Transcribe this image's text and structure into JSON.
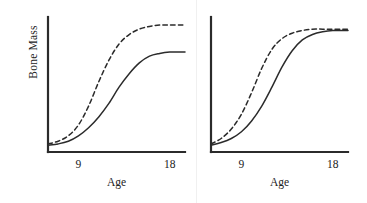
{
  "figure": {
    "background": "#ffffff",
    "ink_color": "#2b2b2b",
    "panel_count": 2
  },
  "chart_data": [
    {
      "type": "line",
      "panel": "left",
      "title": "",
      "xlabel": "Age",
      "ylabel": "Bone Mass",
      "xlim": [
        6,
        19.5
      ],
      "ylim": [
        0,
        100
      ],
      "xticks": [
        9,
        18
      ],
      "xticklabels": [
        "9",
        "18"
      ],
      "yticks": [],
      "yticklabels": [],
      "grid": false,
      "legend": "none",
      "annotation": "Dashed curve rises earlier and plateaus at a higher bone mass than the solid curve; the two curves stay separated at age 18.",
      "x": [
        6,
        7,
        8,
        9,
        10,
        11,
        12,
        13,
        14,
        15,
        16,
        17,
        18,
        19,
        19.5
      ],
      "series": [
        {
          "name": "dashed-curve",
          "style": "dashed",
          "values": [
            6,
            8,
            12,
            20,
            34,
            52,
            68,
            80,
            87,
            91,
            93,
            94,
            94,
            94,
            94
          ]
        },
        {
          "name": "solid-curve",
          "style": "solid",
          "values": [
            5,
            6,
            8,
            12,
            18,
            26,
            36,
            48,
            58,
            66,
            71,
            73,
            74,
            74,
            74
          ]
        }
      ]
    },
    {
      "type": "line",
      "panel": "right",
      "title": "",
      "xlabel": "Age",
      "ylabel": "",
      "xlim": [
        6,
        19.5
      ],
      "ylim": [
        0,
        100
      ],
      "xticks": [
        9,
        18
      ],
      "xticklabels": [
        "9",
        "18"
      ],
      "yticks": [],
      "yticklabels": [],
      "grid": false,
      "legend": "none",
      "annotation": "Dashed curve rises earlier than the solid curve, but both converge to the same plateau bone mass by age 18.",
      "x": [
        6,
        7,
        8,
        9,
        10,
        11,
        12,
        13,
        14,
        15,
        16,
        17,
        18,
        19,
        19.5
      ],
      "series": [
        {
          "name": "dashed-curve",
          "style": "dashed",
          "values": [
            6,
            10,
            17,
            28,
            44,
            62,
            76,
            84,
            88,
            90,
            91,
            91,
            91,
            91,
            91
          ]
        },
        {
          "name": "solid-curve",
          "style": "solid",
          "values": [
            5,
            7,
            10,
            15,
            23,
            34,
            48,
            63,
            75,
            83,
            87,
            89,
            90,
            90,
            90
          ]
        }
      ]
    }
  ]
}
